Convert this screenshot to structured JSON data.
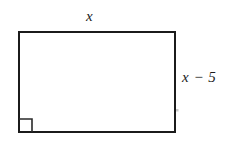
{
  "figure": {
    "kind": "geometry-diagram",
    "shape_name": "rectangle",
    "background_color": "#ffffff",
    "stroke_color": "#1b1b1b",
    "stroke_width": 2,
    "rectangle": {
      "x": 18,
      "y": 31,
      "width": 158,
      "height": 102
    },
    "right_angle_marker": {
      "name": "right-angle-marker",
      "corner": "bottom-left",
      "size": 13
    },
    "labels": {
      "top": "x",
      "right": "x − 5"
    },
    "artifact_dot": {
      "x": 177,
      "y": 110,
      "color": "#c9c9c9"
    }
  }
}
